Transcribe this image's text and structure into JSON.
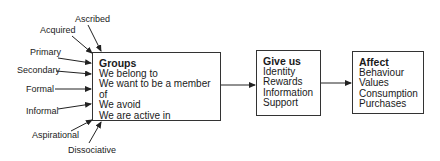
{
  "diagram": {
    "group_types": [
      {
        "label": "Ascribed"
      },
      {
        "label": "Acquired"
      },
      {
        "label": "Primary"
      },
      {
        "label": "Secondary"
      },
      {
        "label": "Formal"
      },
      {
        "label": "Informal"
      },
      {
        "label": "Aspirational"
      },
      {
        "label": "Dissociative"
      }
    ],
    "groups_box": {
      "title": "Groups",
      "lines": [
        "We belong to",
        "We want to be a member of",
        "We avoid",
        "We are active in"
      ]
    },
    "give_us_box": {
      "title": "Give us",
      "lines": [
        "Identity",
        "Rewards",
        "Information",
        "Support"
      ]
    },
    "affect_box": {
      "title": "Affect",
      "lines": [
        "Behaviour",
        "Values",
        "Consumption",
        "Purchases"
      ]
    }
  }
}
